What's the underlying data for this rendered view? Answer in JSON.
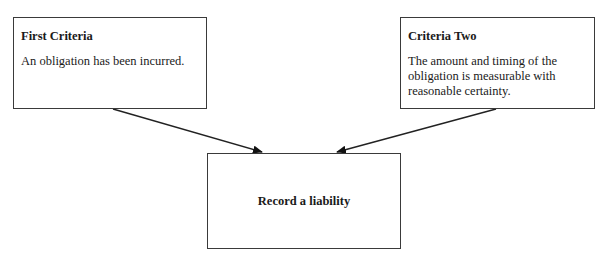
{
  "diagram": {
    "boxes": {
      "first": {
        "title": "First Criteria",
        "body": "An obligation has been incurred."
      },
      "second": {
        "title": "Criteria Two",
        "body": "The amount and timing of the obligation is measurable with reasonable certainty."
      },
      "result": {
        "label": "Record a liability"
      }
    },
    "arrows": [
      {
        "from": "first",
        "to": "result"
      },
      {
        "from": "second",
        "to": "result"
      }
    ],
    "colors": {
      "stroke": "#3a3a3a",
      "text": "#1a1a1a",
      "background": "#ffffff"
    }
  }
}
